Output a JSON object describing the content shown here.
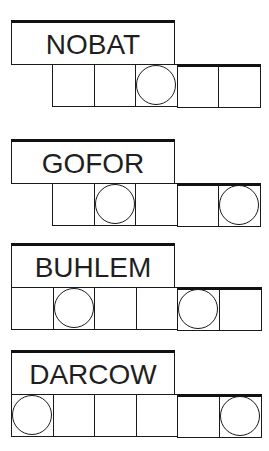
{
  "puzzles": [
    {
      "scrambled": "NOBAT",
      "letters": 5,
      "circled": [
        2
      ],
      "top": 20,
      "squares_left": 52
    },
    {
      "scrambled": "GOFOR",
      "letters": 5,
      "circled": [
        1,
        4
      ],
      "top": 139,
      "squares_left": 52
    },
    {
      "scrambled": "BUHLEM",
      "letters": 6,
      "circled": [
        1,
        4
      ],
      "top": 243,
      "squares_left": 11
    },
    {
      "scrambled": "DARCOW",
      "letters": 6,
      "circled": [
        0,
        5
      ],
      "top": 350,
      "squares_left": 11
    }
  ],
  "colors": {
    "line": "#1a1a1a",
    "text": "#1f1f1f",
    "background": "#ffffff"
  }
}
